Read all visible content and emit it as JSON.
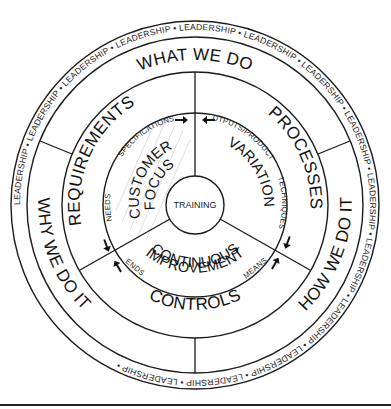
{
  "diagram": {
    "type": "concentric-wheel",
    "outer_ring": {
      "repeated_text": "LEADERSHIP",
      "separator": "•"
    },
    "third_ring_labels": {
      "top": "WHAT WE DO",
      "left": "WHY WE DO IT",
      "right": "HOW WE DO IT"
    },
    "second_ring_labels": {
      "upper_left": "REQUIREMENTS",
      "upper_right": "PROCESSES",
      "bottom": "CONTROLS"
    },
    "inner_ring_labels": {
      "upper_left": [
        "CUSTOMER",
        "FOCUS"
      ],
      "right": "VARIATION",
      "bottom": [
        "CONTINUOUS",
        "IMPROVEMENT"
      ]
    },
    "connector_labels": {
      "specifications": "SPECIFICATIONS",
      "outputs_products": "OUTPUTS/PRODUCTS",
      "needs": "NEEDS",
      "ends": "ENDS",
      "techniques": "TECHNIQUES",
      "means": "MEANS"
    },
    "center": "TRAINING",
    "colors": {
      "stroke": "#1a1a1a",
      "background": "#ffffff",
      "hatch": "#c8c8c8"
    }
  }
}
